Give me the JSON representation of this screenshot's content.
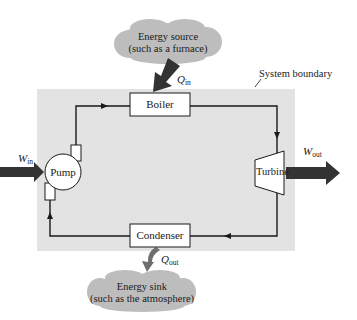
{
  "diagram": {
    "type": "power-cycle-schematic",
    "colors": {
      "background": "#ffffff",
      "system_fill": "#e3e3e3",
      "cloud_fill": "#bdbdbd",
      "arrow_fill": "#333333",
      "qout_arrow_fill": "#6e6e6e",
      "line": "#1a1a1a",
      "box_fill": "#ffffff"
    },
    "system_boundary": {
      "label": "System boundary"
    },
    "components": {
      "boiler": {
        "label": "Boiler"
      },
      "turbine": {
        "label": "Turbine"
      },
      "condenser": {
        "label": "Condenser"
      },
      "pump": {
        "label": "Pump"
      }
    },
    "energy_source": {
      "line1": "Energy source",
      "line2": "(such as a furnace)"
    },
    "energy_sink": {
      "line1": "Energy sink",
      "line2": "(such as the atmosphere)"
    },
    "flows": {
      "q_in": {
        "symbol": "Q",
        "subscript": "in"
      },
      "q_out": {
        "symbol": "Q",
        "subscript": "out"
      },
      "w_in": {
        "symbol": "W",
        "subscript": "in"
      },
      "w_out": {
        "symbol": "W",
        "subscript": "out"
      }
    },
    "loop_direction": [
      "Pump",
      "Boiler",
      "Turbine",
      "Condenser",
      "Pump"
    ]
  }
}
